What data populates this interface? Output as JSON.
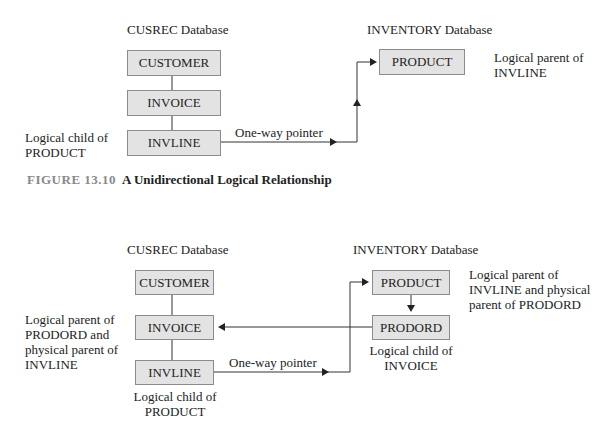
{
  "figure1": {
    "caption_number": "FIGURE 13.10",
    "caption_title": "A Unidirectional Logical Relationship",
    "left_db_label": "CUSREC Database",
    "right_db_label": "INVENTORY Database",
    "segments": {
      "customer": "CUSTOMER",
      "invoice": "INVOICE",
      "invline": "INVLINE",
      "product": "PRODUCT"
    },
    "annotations": {
      "invline_note_line1": "Logical child of",
      "invline_note_line2": "PRODUCT",
      "product_note_line1": "Logical parent of",
      "product_note_line2": "INVLINE",
      "pointer_label": "One-way pointer"
    }
  },
  "figure2": {
    "left_db_label": "CUSREC Database",
    "right_db_label": "INVENTORY Database",
    "segments": {
      "customer": "CUSTOMER",
      "invoice": "INVOICE",
      "invline": "INVLINE",
      "product": "PRODUCT",
      "prodord": "PRODORD"
    },
    "annotations": {
      "invoice_note_line1": "Logical parent of",
      "invoice_note_line2": "PRODORD and",
      "invoice_note_line3": "physical parent of",
      "invoice_note_line4": "INVLINE",
      "invline_note_line1": "Logical child of",
      "invline_note_line2": "PRODUCT",
      "product_note_line1": "Logical parent of",
      "product_note_line2": "INVLINE and physical",
      "product_note_line3": "parent of PRODORD",
      "prodord_note_line1": "Logical child of",
      "prodord_note_line2": "INVOICE",
      "pointer_label": "One-way pointer"
    }
  },
  "colors": {
    "box_fill": "#e3e3e3",
    "box_border": "#8c8c8c",
    "line": "#333333",
    "caption_number": "#8a8a8a"
  }
}
